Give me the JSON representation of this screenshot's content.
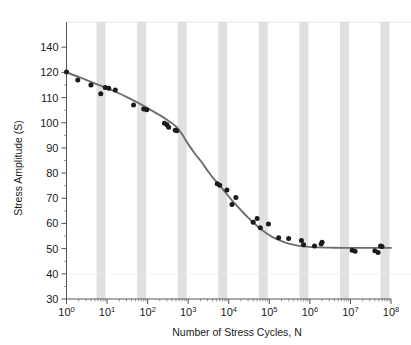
{
  "chart_data": {
    "type": "scatter",
    "title": "",
    "xlabel": "Number of Stress Cycles, N",
    "ylabel": "Stress Amplitude (S)",
    "xscale": "log",
    "yscale": "linear",
    "xlim": [
      1,
      100000000
    ],
    "ylim": [
      30,
      140
    ],
    "grid": false,
    "legend": null,
    "xticklabels": [
      "10^0",
      "10^1",
      "10^2",
      "10^3",
      "10^4",
      "10^5",
      "10^6",
      "10^7",
      "10^8"
    ],
    "xtickvalues": [
      1,
      10,
      100,
      1000,
      10000,
      100000,
      1000000,
      10000000,
      100000000
    ],
    "yticklabels": [
      "140",
      "120",
      "110",
      "100",
      "90",
      "80",
      "70",
      "60",
      "50",
      "40",
      "30"
    ],
    "ytickvalues": [
      140,
      120,
      110,
      100,
      90,
      80,
      70,
      60,
      50,
      40,
      30
    ],
    "band_color": "#e0e0e0",
    "marker_color": "#1a1a1a",
    "line_color": "#6e6e6e",
    "axis_color": "#555555",
    "background": "#ffffff",
    "series": [
      {
        "name": "Fatigue data points",
        "marker": "circle",
        "points": [
          [
            1.0,
            120.3
          ],
          [
            1.9,
            117.0
          ],
          [
            4.0,
            115.0
          ],
          [
            7.0,
            111.5
          ],
          [
            9.0,
            114.0
          ],
          [
            11.0,
            113.7
          ],
          [
            16.0,
            113.0
          ],
          [
            45.0,
            107.0
          ],
          [
            80.0,
            105.5
          ],
          [
            95.0,
            105.2
          ],
          [
            260.0,
            99.8
          ],
          [
            300.0,
            99.2
          ],
          [
            330.0,
            98.2
          ],
          [
            480.0,
            97.0
          ],
          [
            520.0,
            96.8
          ],
          [
            5200.0,
            75.8
          ],
          [
            6000.0,
            75.2
          ],
          [
            9000.0,
            73.3
          ],
          [
            12000.0,
            67.5
          ],
          [
            15000.0,
            70.3
          ],
          [
            40000.0,
            60.5
          ],
          [
            50000.0,
            62.0
          ],
          [
            60000.0,
            58.3
          ],
          [
            95000.0,
            59.8
          ],
          [
            170000.0,
            54.3
          ],
          [
            300000.0,
            54.0
          ],
          [
            620000.0,
            53.2
          ],
          [
            700000.0,
            51.5
          ],
          [
            1300000.0,
            51.0
          ],
          [
            1900000.0,
            51.8
          ],
          [
            2000000.0,
            52.5
          ],
          [
            11000000.0,
            49.4
          ],
          [
            13000000.0,
            49.0
          ],
          [
            40000000.0,
            49.2
          ],
          [
            48000000.0,
            48.5
          ],
          [
            55000000.0,
            51.0
          ],
          [
            60000000.0,
            50.8
          ]
        ]
      }
    ],
    "fit_curve": {
      "name": "S-N fitted curve",
      "points": [
        [
          1.0,
          120.0
        ],
        [
          2.0,
          118.2
        ],
        [
          4.0,
          116.2
        ],
        [
          8.0,
          114.3
        ],
        [
          15.0,
          112.5
        ],
        [
          30.0,
          110.3
        ],
        [
          60.0,
          107.8
        ],
        [
          100.0,
          105.8
        ],
        [
          200.0,
          103.0
        ],
        [
          350.0,
          100.4
        ],
        [
          500.0,
          98.5
        ],
        [
          700.0,
          95.5
        ],
        [
          1000.0,
          91.5
        ],
        [
          1500.0,
          87.5
        ],
        [
          2000.0,
          85.0
        ],
        [
          3000.0,
          81.0
        ],
        [
          4000.0,
          78.3
        ],
        [
          6000.0,
          75.0
        ],
        [
          8000.0,
          72.6
        ],
        [
          12000.0,
          69.2
        ],
        [
          20000.0,
          65.3
        ],
        [
          30000.0,
          62.3
        ],
        [
          50000.0,
          59.0
        ],
        [
          80000.0,
          56.4
        ],
        [
          120000.0,
          54.6
        ],
        [
          200000.0,
          53.0
        ],
        [
          300000.0,
          52.0
        ],
        [
          500000.0,
          51.2
        ],
        [
          800000.0,
          50.8
        ],
        [
          1500000.0,
          50.5
        ],
        [
          3000000.0,
          50.4
        ],
        [
          10000000.0,
          50.3
        ],
        [
          100000000.0,
          50.3
        ]
      ]
    },
    "annotations": []
  }
}
